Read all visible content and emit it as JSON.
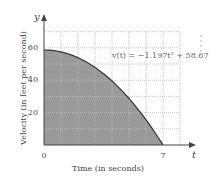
{
  "chart_data": {
    "type": "area",
    "title": "",
    "xlabel": "Time (in seconds)",
    "ylabel": "Velocity (in feet per second)",
    "x_axis_letter": "t",
    "y_axis_letter": "y",
    "equation": "v(t) = −1.197t² + 58.67",
    "function": {
      "a": -1.197,
      "c": 58.67
    },
    "xlim": [
      0,
      8
    ],
    "ylim": [
      0,
      70
    ],
    "x_ticks_labeled": [
      {
        "value": 0,
        "label": "0"
      },
      {
        "value": 7,
        "label": "7"
      }
    ],
    "y_ticks_labeled": [
      {
        "value": 20,
        "label": "20"
      },
      {
        "value": 40,
        "label": "40"
      },
      {
        "value": 60,
        "label": "60"
      }
    ],
    "grid": true,
    "grid_x_step": 1,
    "grid_y_step": 10,
    "shaded_region": {
      "from": 0,
      "to": 7,
      "color": "#9a9a9a"
    },
    "x": [
      0,
      1,
      2,
      3,
      4,
      5,
      6,
      7
    ],
    "values": [
      58.67,
      57.47,
      53.88,
      47.9,
      39.52,
      28.75,
      15.58,
      0.02
    ]
  },
  "colors": {
    "fill": "#9a9a9a",
    "curve": "#333333",
    "grid": "#bbbbbb",
    "axis": "#444444"
  }
}
